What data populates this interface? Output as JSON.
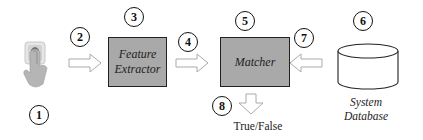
{
  "diagram": {
    "title": "",
    "nodes": [
      {
        "id": "1",
        "step": "1",
        "label": "",
        "icon": "fingerprint-touch-icon"
      },
      {
        "id": "3",
        "step": "3",
        "label_line1": "Feature",
        "label_line2": "Extractor"
      },
      {
        "id": "5",
        "step": "5",
        "label": "Matcher"
      },
      {
        "id": "6",
        "step": "6",
        "label_line1": "System",
        "label_line2": "Database",
        "shape": "cylinder"
      }
    ],
    "edges": [
      {
        "step": "2",
        "from": "1",
        "to": "3",
        "direction": "right"
      },
      {
        "step": "4",
        "from": "3",
        "to": "5",
        "direction": "right"
      },
      {
        "step": "7",
        "from": "6",
        "to": "5",
        "direction": "left"
      },
      {
        "step": "8",
        "from": "5",
        "to": "output",
        "direction": "down",
        "label": "True/False"
      }
    ],
    "colors": {
      "box_fill": "#a9a9a9",
      "box_border": "#222222",
      "arrow_stroke": "#aaaaaa",
      "circle_border": "#111111"
    }
  },
  "steps": {
    "s1": "1",
    "s2": "2",
    "s3": "3",
    "s4": "4",
    "s5": "5",
    "s6": "6",
    "s7": "7",
    "s8": "8"
  },
  "labels": {
    "feature_1": "Feature",
    "feature_2": "Extractor",
    "matcher": "Matcher",
    "db_1": "System",
    "db_2": "Database",
    "output": "True/False"
  }
}
